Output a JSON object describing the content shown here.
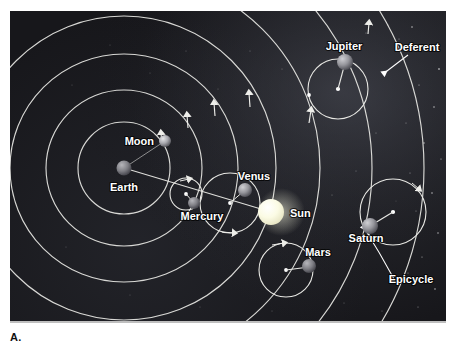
{
  "figure": {
    "panel_label": "A.",
    "caption_label_color": "#111111",
    "background_color": "#17171b",
    "orbit_line_color": "#e8e8e4",
    "star_color": "#ffffff"
  },
  "diagram": {
    "type": "ptolemaic-geocentric-model",
    "center_body": "Earth",
    "center": {
      "x": 124,
      "y": 168
    },
    "deferent_radii": [
      46,
      78,
      114,
      152,
      196,
      242
    ],
    "labels": [
      {
        "name": "earth-label",
        "text": "Earth",
        "x": 124,
        "y": 187
      },
      {
        "name": "moon-label",
        "text": "Moon",
        "x": 140,
        "y": 141
      },
      {
        "name": "mercury-label",
        "text": "Mercury",
        "x": 201,
        "y": 216
      },
      {
        "name": "venus-label",
        "text": "Venus",
        "x": 254,
        "y": 176
      },
      {
        "name": "sun-label",
        "text": "Sun",
        "x": 296,
        "y": 213
      },
      {
        "name": "mars-label",
        "text": "Mars",
        "x": 320,
        "y": 253
      },
      {
        "name": "jupiter-label",
        "text": "Jupiter",
        "x": 344,
        "y": 46
      },
      {
        "name": "saturn-label",
        "text": "Saturn",
        "x": 366,
        "y": 238
      },
      {
        "name": "deferent-label",
        "text": "Deferent",
        "x": 417,
        "y": 47
      },
      {
        "name": "epicycle-label",
        "text": "Epicycle",
        "x": 411,
        "y": 280
      }
    ],
    "bodies": [
      {
        "name": "earth",
        "label": "Earth",
        "x": 124,
        "y": 168,
        "r": 7.5,
        "color": "#8d8d92"
      },
      {
        "name": "moon",
        "label": "Moon",
        "x": 165,
        "y": 141,
        "r": 6,
        "color": "#c9c9c4"
      },
      {
        "name": "mercury",
        "label": "Mercury",
        "x": 194,
        "y": 203,
        "r": 6,
        "color": "#8b8b90"
      },
      {
        "name": "venus",
        "label": "Venus",
        "x": 245,
        "y": 190,
        "r": 7,
        "color": "#9d9da2"
      },
      {
        "name": "sun",
        "label": "Sun",
        "x": 271,
        "y": 212,
        "r": 13,
        "color": "#fdfde6"
      },
      {
        "name": "mars",
        "label": "Mars",
        "x": 309,
        "y": 266,
        "r": 7,
        "color": "#8c8c91"
      },
      {
        "name": "jupiter",
        "label": "Jupiter",
        "x": 345,
        "y": 62,
        "r": 8,
        "color": "#9e9ea3"
      },
      {
        "name": "saturn",
        "label": "Saturn",
        "x": 370,
        "y": 226,
        "r": 8,
        "color": "#9a9a9f"
      }
    ],
    "epicycles": [
      {
        "name": "mercury-epicycle",
        "cx": 186,
        "cy": 194,
        "r": 15
      },
      {
        "name": "venus-epicycle",
        "cx": 230,
        "cy": 203,
        "r": 29
      },
      {
        "name": "mars-epicycle",
        "cx": 286,
        "cy": 270,
        "r": 26
      },
      {
        "name": "jupiter-epicycle",
        "cx": 338,
        "cy": 89,
        "r": 29
      },
      {
        "name": "saturn-epicycle",
        "cx": 393,
        "cy": 212,
        "r": 32
      },
      {
        "name": "moon-orbit",
        "cx": 124,
        "cy": 168,
        "r": 46
      }
    ]
  }
}
